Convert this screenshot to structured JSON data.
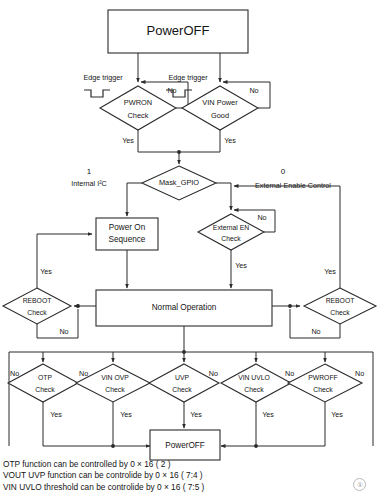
{
  "diagram": {
    "title_top": "PowerOFF",
    "title_bottom": "PowerOFF",
    "nodes": {
      "power_off_top": "PowerOFF",
      "pwron_check_l1": "PWRON",
      "pwron_check_l2": "Check",
      "vin_power_good_l1": "VIN Power",
      "vin_power_good_l2": "Good",
      "mask_gpio": "Mask_GPIO",
      "power_on_seq_l1": "Power On",
      "power_on_seq_l2": "Sequence",
      "external_en_check_l1": "External EN",
      "external_en_check_l2": "Check",
      "normal_operation": "Normal Operation",
      "reboot_check_left_l1": "REBOOT",
      "reboot_check_left_l2": "Check",
      "reboot_check_right_l1": "REBOOT",
      "reboot_check_right_l2": "Check",
      "otp_check_l1": "OTP",
      "otp_check_l2": "Check",
      "vin_ovp_check_l1": "VIN OVP",
      "vin_ovp_check_l2": "Check",
      "uvp_check_l1": "UVP",
      "uvp_check_l2": "Check",
      "vin_uvlo_check_l1": "VIN UVLO",
      "vin_uvlo_check_l2": "Check",
      "pwroff_check_l1": "PWROFF",
      "pwroff_check_l2": "Check",
      "power_off_bottom": "PowerOFF"
    },
    "edge_labels": {
      "edge_trigger_left": "Edge trigger",
      "edge_trigger_right": "Edge trigger",
      "no_pwron": "No",
      "no_vin_pg": "No",
      "yes_pwron": "Yes",
      "yes_vin_pg": "Yes",
      "mask_one": "1",
      "mask_internal_i2c": "Internal I²C",
      "mask_zero": "0",
      "mask_external_enable": "External Enable Control",
      "no_external_en": "No",
      "yes_external_en": "Yes",
      "yes_reboot_left": "Yes",
      "no_reboot_left": "No",
      "yes_reboot_right": "Yes",
      "no_reboot_right": "No",
      "no_otp": "No",
      "yes_otp": "Yes",
      "no_vin_ovp": "No",
      "yes_vin_ovp": "Yes",
      "no_uvp": "No",
      "yes_uvp": "Yes",
      "no_vin_uvlo": "No",
      "yes_vin_uvlo": "Yes",
      "no_pwroff": "No",
      "yes_pwroff": "Yes"
    }
  },
  "notes": [
    "OTP function can be controlled by 0 × 16 ( 2 )",
    "VOUT UVP function can be controlide by 0 × 16 ( 7:4 )",
    "VIN UVLO threshold can be controlide by 0 × 16 ( 7:5 )"
  ],
  "page_mark": "①"
}
